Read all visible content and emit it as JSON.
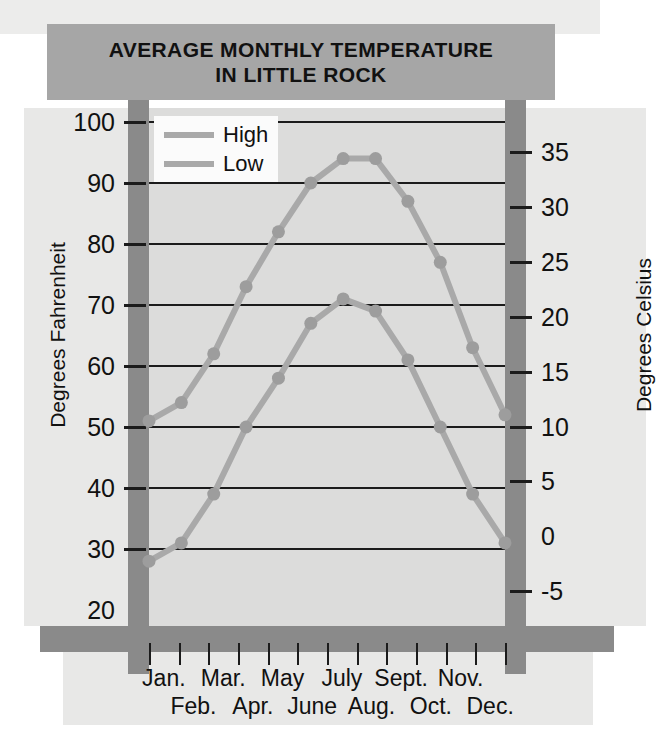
{
  "title": {
    "line1": "AVERAGE MONTHLY TEMPERATURE",
    "line2": "IN LITTLE ROCK"
  },
  "axes": {
    "left_label": "Degrees Fahrenheit",
    "right_label": "Degrees Celsius",
    "left_ticks": [
      "100",
      "90",
      "80",
      "70",
      "60",
      "50",
      "40",
      "30",
      "20"
    ],
    "right_ticks": [
      "35",
      "30",
      "25",
      "20",
      "15",
      "10",
      "5",
      "0",
      "-5"
    ]
  },
  "legend": {
    "items": [
      {
        "label": "High",
        "color": "#a9a9a9"
      },
      {
        "label": "Low",
        "color": "#a9a9a9"
      }
    ]
  },
  "months_row1": [
    "Jan.",
    "Mar.",
    "May",
    "July",
    "Sept.",
    "Nov."
  ],
  "months_row2": [
    "Feb.",
    "Apr.",
    "June",
    "Aug.",
    "Oct.",
    "Dec."
  ],
  "colors": {
    "title_bar": "#a6a6a6",
    "frame": "#8a8a8a",
    "plot_bg": "#dcdcdb",
    "paper": "#e8e8e7",
    "gridline": "#1b1b1b",
    "series": "#a9a9a9",
    "text": "#111111"
  },
  "chart_data": {
    "type": "line",
    "title": "AVERAGE MONTHLY TEMPERATURE IN LITTLE ROCK",
    "xlabel": "",
    "ylabel": "Degrees Fahrenheit",
    "ylabel_secondary": "Degrees Celsius",
    "categories": [
      "Jan.",
      "Feb.",
      "Mar.",
      "Apr.",
      "May",
      "June",
      "July",
      "Aug.",
      "Sept.",
      "Oct.",
      "Nov.",
      "Dec."
    ],
    "series": [
      {
        "name": "High",
        "values": [
          51,
          54,
          62,
          73,
          82,
          90,
          94,
          94,
          87,
          77,
          63,
          52
        ]
      },
      {
        "name": "Low",
        "values": [
          28,
          31,
          39,
          50,
          58,
          67,
          71,
          69,
          61,
          50,
          39,
          31
        ]
      }
    ],
    "ylim": [
      20,
      100
    ],
    "yticks": [
      20,
      30,
      40,
      50,
      60,
      70,
      80,
      90,
      100
    ],
    "ylim_secondary": [
      -6.7,
      37.8
    ],
    "yticks_secondary": [
      -5,
      0,
      5,
      10,
      15,
      20,
      25,
      30,
      35
    ],
    "gridlines": true,
    "legend_position": "top-left",
    "units": "Fahrenheit (left) / Celsius (right)"
  }
}
